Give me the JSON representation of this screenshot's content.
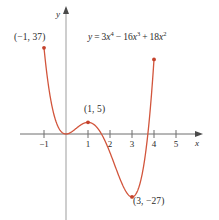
{
  "figure": {
    "equation_plain": "y = 3x^4 - 16x^3 + 18x^2",
    "curve_color": "#d2553c",
    "axis_color": "#8c8c8c",
    "text_color": "#2b2b2b"
  },
  "equation": {
    "lhs": "y",
    "equals": "=",
    "term1_coef": "3",
    "term1_var": "x",
    "term1_exp": "4",
    "op1": "−",
    "term2_coef": "16",
    "term2_var": "x",
    "term2_exp": "3",
    "op2": "+",
    "term3_coef": "18",
    "term3_var": "x",
    "term3_exp": "2"
  },
  "axes": {
    "x_name": "x",
    "y_name": "y",
    "x_ticks": [
      "−1",
      "1",
      "2",
      "3",
      "4",
      "5"
    ],
    "x_tick_values": [
      -1,
      1,
      2,
      3,
      4,
      5
    ]
  },
  "annotations": {
    "left_endpoint": "(−1, 37)",
    "local_max": "(1, 5)",
    "local_min": "(3, −27)"
  },
  "chart_data": {
    "type": "line",
    "title": "",
    "subtitle": "",
    "xlabel": "x",
    "ylabel": "y",
    "legend": [],
    "grid": false,
    "function": "y = 3x^4 - 16x^3 + 18x^2",
    "coefficients": {
      "x4": 3,
      "x3": -16,
      "x2": 18,
      "x1": 0,
      "x0": 0
    },
    "xlim": [
      -1.2,
      5.6
    ],
    "ylim": [
      -34,
      42
    ],
    "x_ticks": [
      -1,
      1,
      2,
      3,
      4,
      5
    ],
    "y_ticks": [],
    "marked_points": [
      {
        "label": "(−1, 37)",
        "x": -1,
        "y": 37
      },
      {
        "label": "(1, 5)",
        "x": 1,
        "y": 5
      },
      {
        "label": "(3, −27)",
        "x": 3,
        "y": -27
      },
      {
        "label": "",
        "x": 4,
        "y": 32
      }
    ],
    "domain_drawn": [
      -1,
      4
    ],
    "x": [
      -1.0,
      -0.9,
      -0.8,
      -0.7,
      -0.6,
      -0.5,
      -0.4,
      -0.3,
      -0.2,
      -0.1,
      0.0,
      0.1,
      0.2,
      0.3,
      0.4,
      0.5,
      0.6,
      0.7,
      0.8,
      0.9,
      1.0,
      1.1,
      1.2,
      1.3,
      1.4,
      1.5,
      1.6,
      1.7,
      1.8,
      1.9,
      2.0,
      2.1,
      2.2,
      2.3,
      2.4,
      2.5,
      2.6,
      2.7,
      2.8,
      2.9,
      3.0,
      3.1,
      3.2,
      3.3,
      3.4,
      3.5,
      3.6,
      3.7,
      3.8,
      3.9,
      4.0
    ],
    "y": [
      37.0,
      28.7,
      21.9,
      16.4,
      12.0,
      8.6,
      6.0,
      4.0,
      2.6,
      1.5,
      0.0,
      0.2,
      0.6,
      1.2,
      1.9,
      2.6,
      3.3,
      3.9,
      4.4,
      4.8,
      5.0,
      5.0,
      4.8,
      4.3,
      3.5,
      2.4,
      0.9,
      -1.0,
      -3.3,
      -6.1,
      -9.3,
      -12.9,
      -16.9,
      -21.1,
      -25.4,
      -29.7,
      -33.7,
      -37.3,
      -40.2,
      -42.0,
      -43.0,
      -41.5,
      -38.0,
      -32.2,
      -23.6,
      -11.9,
      3.5,
      23.0,
      47.0,
      76.0,
      112.0
    ]
  }
}
